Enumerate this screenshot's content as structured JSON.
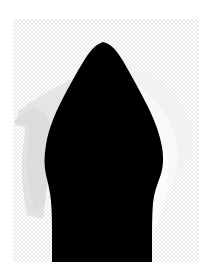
{
  "view": {
    "name": "image-canvas-view",
    "background_color": "#ffffff",
    "width": 213,
    "height": 279
  },
  "canvas": {
    "label": "Transparent canvas",
    "x": 13,
    "y": 19,
    "width": 186,
    "height": 243,
    "checker_light": "#ffffff",
    "checker_dark": "#e9e9e9",
    "checker_size_px": 2
  },
  "artwork": {
    "title": "Black arrow silhouette on transparent background",
    "subject": "pointed arrow / pen-nib shape",
    "layers": [
      {
        "name": "light-gray-smear-left",
        "description": "Soft light-gray brush smear extending to the left of the shape",
        "color": "#dcdcdc",
        "opacity": 1
      },
      {
        "name": "near-white-smear-right",
        "description": "Soft near-white brush smear extending to the right of the shape",
        "color": "#f4f4f4",
        "opacity": 1
      },
      {
        "name": "black-arrow-shape",
        "description": "Solid black pointed arrow body running off the bottom edge",
        "color": "#000000",
        "opacity": 1
      }
    ],
    "apex": {
      "x": 106,
      "y": 43
    },
    "base_left_x": 48,
    "base_right_x": 163
  }
}
